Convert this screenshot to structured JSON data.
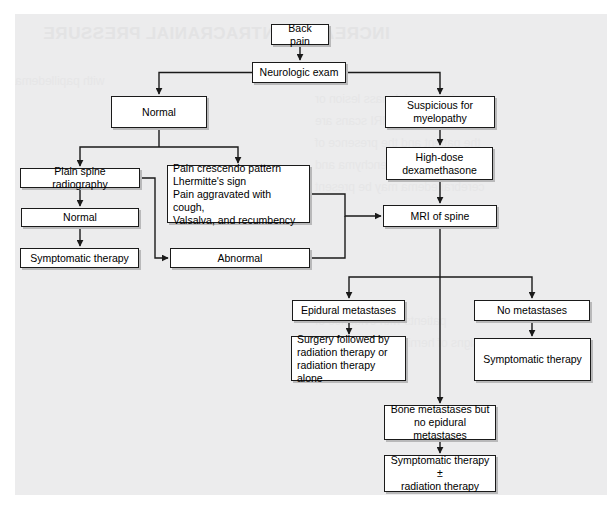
{
  "page": {
    "background_color": "#ececed",
    "paper_color": "#ffffff",
    "line_color": "#1a1a1a",
    "shadow_color": "#b9b9ba"
  },
  "bleed_text": {
    "heading": "INCREASED INTRACRANIAL PRESSURE",
    "lines": [
      "with papilledema",
      "an intracranial mass lesion or",
      "study. CT and MRI scans are",
      "the patient and the presence of",
      "of the brain parenchyma and",
      "cerebral edema may be present",
      "patients with evidence of",
      "signs of herniation may require"
    ]
  },
  "nodes": [
    {
      "id": "back-pain",
      "label": "Back pain",
      "x": 271,
      "y": 24,
      "w": 58,
      "h": 21,
      "align": "center"
    },
    {
      "id": "neurologic-exam",
      "label": "Neurologic exam",
      "x": 252,
      "y": 62,
      "w": 94,
      "h": 21,
      "align": "center"
    },
    {
      "id": "normal-top",
      "label": "Normal",
      "x": 111,
      "y": 96,
      "w": 96,
      "h": 32,
      "align": "center"
    },
    {
      "id": "suspicious-myelopathy",
      "label": "Suspicious for\nmyelopathy",
      "x": 385,
      "y": 96,
      "w": 110,
      "h": 32,
      "align": "center"
    },
    {
      "id": "high-dose-dex",
      "label": "High-dose\ndexamethasone",
      "x": 386,
      "y": 147,
      "w": 107,
      "h": 33,
      "align": "center"
    },
    {
      "id": "plain-spine-radio",
      "label": "Plain spine radiography",
      "x": 20,
      "y": 168,
      "w": 120,
      "h": 20,
      "align": "center"
    },
    {
      "id": "red-flags",
      "label": "Pain crescendo pattern\nLhermitte's sign\nPain aggravated with cough,\nValsalva, and recumbency",
      "x": 167,
      "y": 165,
      "w": 143,
      "h": 58,
      "align": "left"
    },
    {
      "id": "normal-radio",
      "label": "Normal",
      "x": 21,
      "y": 208,
      "w": 118,
      "h": 19,
      "align": "center"
    },
    {
      "id": "mri-of-spine",
      "label": "MRI of spine",
      "x": 383,
      "y": 205,
      "w": 114,
      "h": 22,
      "align": "center"
    },
    {
      "id": "symptomatic-therapy-1",
      "label": "Symptomatic therapy",
      "x": 20,
      "y": 248,
      "w": 119,
      "h": 20,
      "align": "center"
    },
    {
      "id": "abnormal",
      "label": "Abnormal",
      "x": 170,
      "y": 248,
      "w": 140,
      "h": 20,
      "align": "center"
    },
    {
      "id": "epidural-metastases",
      "label": "Epidural metastases",
      "x": 292,
      "y": 300,
      "w": 113,
      "h": 21,
      "align": "center"
    },
    {
      "id": "no-metastases",
      "label": "No metastases",
      "x": 474,
      "y": 300,
      "w": 116,
      "h": 21,
      "align": "center"
    },
    {
      "id": "surgery-radiation",
      "label": "Surgery followed by\nradiation therapy or\nradiation therapy alone",
      "x": 291,
      "y": 336,
      "w": 115,
      "h": 45,
      "align": "left"
    },
    {
      "id": "symptomatic-therapy-2",
      "label": "Symptomatic therapy",
      "x": 474,
      "y": 338,
      "w": 117,
      "h": 43,
      "align": "center"
    },
    {
      "id": "bone-metastases",
      "label": "Bone metastases but\nno epidural metastases",
      "x": 384,
      "y": 405,
      "w": 112,
      "h": 35,
      "align": "center"
    },
    {
      "id": "symptomatic-radiation",
      "label": "Symptomatic therapy ±\nradiation therapy",
      "x": 384,
      "y": 455,
      "w": 112,
      "h": 37,
      "align": "center"
    }
  ],
  "connectors": [
    {
      "from": "back-pain",
      "to": "neurologic-exam",
      "kind": "vertical-arrow"
    },
    {
      "from": "neurologic-exam",
      "to": "normal-top",
      "kind": "elbow-left-arrow"
    },
    {
      "from": "neurologic-exam",
      "to": "suspicious-myelopathy",
      "kind": "elbow-right-arrow"
    },
    {
      "from": "normal-top",
      "to": "plain-spine-radio",
      "kind": "elbow-left-arrow"
    },
    {
      "from": "normal-top",
      "to": "red-flags",
      "kind": "elbow-right-arrow"
    },
    {
      "from": "suspicious-myelopathy",
      "to": "high-dose-dex",
      "kind": "vertical-arrow"
    },
    {
      "from": "high-dose-dex",
      "to": "mri-of-spine",
      "kind": "vertical-arrow"
    },
    {
      "from": "plain-spine-radio",
      "to": "normal-radio",
      "kind": "vertical-arrow"
    },
    {
      "from": "plain-spine-radio",
      "to": "abnormal",
      "kind": "elbow-down-arrow"
    },
    {
      "from": "normal-radio",
      "to": "symptomatic-therapy-1",
      "kind": "vertical-arrow"
    },
    {
      "from": "red-flags",
      "to": "mri-of-spine",
      "kind": "elbow-right-arrow"
    },
    {
      "from": "abnormal",
      "to": "mri-of-spine",
      "kind": "elbow-right-arrow"
    },
    {
      "from": "mri-of-spine",
      "to": "epidural-metastases",
      "kind": "elbow-left-arrow"
    },
    {
      "from": "mri-of-spine",
      "to": "no-metastases",
      "kind": "elbow-right-arrow"
    },
    {
      "from": "mri-of-spine",
      "to": "bone-metastases",
      "kind": "vertical-arrow"
    },
    {
      "from": "epidural-metastases",
      "to": "surgery-radiation",
      "kind": "vertical-arrow"
    },
    {
      "from": "no-metastases",
      "to": "symptomatic-therapy-2",
      "kind": "vertical-arrow"
    },
    {
      "from": "bone-metastases",
      "to": "symptomatic-radiation",
      "kind": "vertical-arrow"
    }
  ]
}
